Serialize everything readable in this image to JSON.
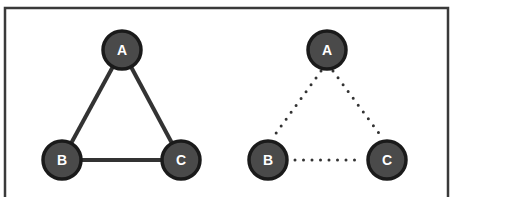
{
  "colors": {
    "frame": "#3a3a3a",
    "node_fill": "#4a4a4a",
    "node_stroke": "#1a1a1a",
    "edge": "#333333",
    "label": "#ffffff",
    "background": "#ffffff"
  },
  "diagrams": [
    {
      "name": "connected-graph",
      "edge_style": "solid",
      "nodes": [
        {
          "id": "A",
          "label": "A",
          "x": 122,
          "y": 50
        },
        {
          "id": "B",
          "label": "B",
          "x": 62,
          "y": 160
        },
        {
          "id": "C",
          "label": "C",
          "x": 181,
          "y": 160
        }
      ],
      "edges": [
        [
          "A",
          "B"
        ],
        [
          "A",
          "C"
        ],
        [
          "B",
          "C"
        ]
      ]
    },
    {
      "name": "potential-graph",
      "edge_style": "dotted",
      "nodes": [
        {
          "id": "A",
          "label": "A",
          "x": 327,
          "y": 50
        },
        {
          "id": "B",
          "label": "B",
          "x": 268,
          "y": 160
        },
        {
          "id": "C",
          "label": "C",
          "x": 387,
          "y": 160
        }
      ],
      "edges": [
        [
          "A",
          "B"
        ],
        [
          "A",
          "C"
        ],
        [
          "B",
          "C"
        ]
      ]
    }
  ]
}
